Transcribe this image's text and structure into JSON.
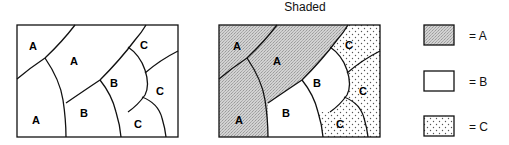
{
  "title": "Shaded",
  "maps": [
    {
      "name": "unshaded-map",
      "regions": [
        {
          "label": "A",
          "x": 34,
          "y": 46
        },
        {
          "label": "A",
          "x": 74,
          "y": 61
        },
        {
          "label": "A",
          "x": 37,
          "y": 120
        },
        {
          "label": "B",
          "x": 84,
          "y": 114
        },
        {
          "label": "B",
          "x": 114,
          "y": 83
        },
        {
          "label": "C",
          "x": 144,
          "y": 45
        },
        {
          "label": "C",
          "x": 160,
          "y": 91
        },
        {
          "label": "C",
          "x": 139,
          "y": 124
        }
      ]
    },
    {
      "name": "shaded-map",
      "regions": [
        {
          "label": "A",
          "x": 239,
          "y": 46
        },
        {
          "label": "A",
          "x": 277,
          "y": 61
        },
        {
          "label": "A",
          "x": 239,
          "y": 120
        },
        {
          "label": "B",
          "x": 286,
          "y": 114
        },
        {
          "label": "B",
          "x": 317,
          "y": 83
        },
        {
          "label": "C",
          "x": 350,
          "y": 45
        },
        {
          "label": "C",
          "x": 363,
          "y": 91
        },
        {
          "label": "C",
          "x": 340,
          "y": 124
        }
      ]
    }
  ],
  "legend": [
    {
      "swatch": "gray-stipple",
      "label": "= A"
    },
    {
      "swatch": "white",
      "label": "= B"
    },
    {
      "swatch": "dotted",
      "label": "= C"
    }
  ],
  "colors": {
    "line": "#111111",
    "fill_A": "#c8c8c8",
    "fill_B": "#ffffff",
    "dot_C": "#555555"
  }
}
